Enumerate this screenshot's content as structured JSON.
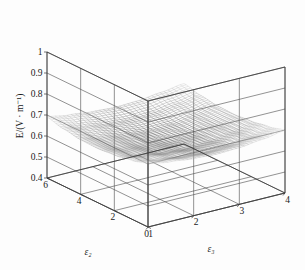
{
  "chart_data": {
    "type": "surface",
    "title": "",
    "zlabel": "E/(V · m⁻¹)",
    "xlabel": "ε₂",
    "ylabel": "ε₃",
    "zlim": [
      0.4,
      1.0
    ],
    "zticks": [
      "0.4",
      "0.5",
      "0.6",
      "0.7",
      "0.8",
      "0.9",
      "1"
    ],
    "ztick_values": [
      0.4,
      0.5,
      0.6,
      0.7,
      0.8,
      0.9,
      1.0
    ],
    "xlim": [
      0,
      6
    ],
    "xticks": [
      "0",
      "2",
      "4",
      "6"
    ],
    "xtick_values": [
      0,
      2,
      4,
      6
    ],
    "ylim": [
      1,
      4
    ],
    "yticks": [
      "1",
      "2",
      "3",
      "4"
    ],
    "ytick_values": [
      1,
      2,
      3,
      4
    ],
    "grid": true,
    "legend": "none",
    "colormap": "gray",
    "surface_shape": "saddle-valley",
    "z_min_observed": 0.6,
    "z_max_observed": 0.7,
    "x_grid": [
      0,
      1,
      2,
      3,
      4,
      5,
      6
    ],
    "y_grid": [
      1,
      1.5,
      2,
      2.5,
      3,
      3.5,
      4
    ],
    "z_matrix": [
      [
        0.7,
        0.68,
        0.665,
        0.658,
        0.66,
        0.672,
        0.69
      ],
      [
        0.684,
        0.662,
        0.646,
        0.638,
        0.641,
        0.654,
        0.674
      ],
      [
        0.672,
        0.648,
        0.63,
        0.622,
        0.626,
        0.64,
        0.662
      ],
      [
        0.666,
        0.641,
        0.622,
        0.614,
        0.618,
        0.633,
        0.656
      ],
      [
        0.67,
        0.645,
        0.627,
        0.619,
        0.623,
        0.638,
        0.66
      ],
      [
        0.682,
        0.66,
        0.644,
        0.637,
        0.64,
        0.653,
        0.673
      ],
      [
        0.698,
        0.678,
        0.664,
        0.657,
        0.659,
        0.67,
        0.688
      ]
    ]
  },
  "axes": {
    "z": {
      "title": "E/(V · m⁻¹)",
      "ticks": [
        "1",
        "0.9",
        "0.8",
        "0.7",
        "0.6",
        "0.5",
        "0.4"
      ]
    },
    "x": {
      "title": "ε₂",
      "ticks": [
        "6",
        "4",
        "2",
        "0"
      ]
    },
    "y": {
      "title": "ε₃",
      "ticks": [
        "1",
        "2",
        "3",
        "4"
      ]
    }
  },
  "style": {
    "background": "#fdfdfd",
    "grid_color": "#4a4a4a",
    "axis_color": "#3a3a3a",
    "text_color": "#1a1a1a",
    "mesh_dark": "#1c1c1c",
    "mesh_light": "#d8d8d8"
  }
}
